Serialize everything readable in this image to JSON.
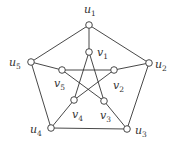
{
  "diagram": {
    "colors": {
      "stroke": "#333333",
      "node_fill": "#ffffff",
      "background": "#ffffff"
    },
    "nodes": [
      {
        "id": "u1",
        "base": "u",
        "sub": "1",
        "x": 89,
        "y": 25,
        "lx": 84,
        "ly": 13
      },
      {
        "id": "u2",
        "base": "u",
        "sub": "2",
        "x": 149,
        "y": 63,
        "lx": 155,
        "ly": 68
      },
      {
        "id": "u3",
        "base": "u",
        "sub": "3",
        "x": 127,
        "y": 129,
        "lx": 135,
        "ly": 134
      },
      {
        "id": "u4",
        "base": "u",
        "sub": "4",
        "x": 51,
        "y": 128,
        "lx": 30,
        "ly": 133
      },
      {
        "id": "u5",
        "base": "u",
        "sub": "5",
        "x": 31,
        "y": 62,
        "lx": 9,
        "ly": 66
      },
      {
        "id": "v1",
        "base": "v",
        "sub": "1",
        "x": 89,
        "y": 52,
        "lx": 97,
        "ly": 56
      },
      {
        "id": "v2",
        "base": "v",
        "sub": "2",
        "x": 114,
        "y": 70,
        "lx": 113,
        "ly": 89
      },
      {
        "id": "v3",
        "base": "v",
        "sub": "3",
        "x": 104,
        "y": 101,
        "lx": 100,
        "ly": 119
      },
      {
        "id": "v4",
        "base": "v",
        "sub": "4",
        "x": 74,
        "y": 100,
        "lx": 72,
        "ly": 118
      },
      {
        "id": "v5",
        "base": "v",
        "sub": "5",
        "x": 62,
        "y": 70,
        "lx": 54,
        "ly": 87
      }
    ],
    "edges": [
      [
        "u1",
        "u2"
      ],
      [
        "u2",
        "u3"
      ],
      [
        "u3",
        "u4"
      ],
      [
        "u4",
        "u5"
      ],
      [
        "u5",
        "u1"
      ],
      [
        "u1",
        "v1"
      ],
      [
        "u2",
        "v2"
      ],
      [
        "u3",
        "v3"
      ],
      [
        "u4",
        "v4"
      ],
      [
        "u5",
        "v5"
      ],
      [
        "v1",
        "v3"
      ],
      [
        "v3",
        "v5"
      ],
      [
        "v5",
        "v2"
      ],
      [
        "v2",
        "v4"
      ],
      [
        "v4",
        "v1"
      ]
    ]
  }
}
